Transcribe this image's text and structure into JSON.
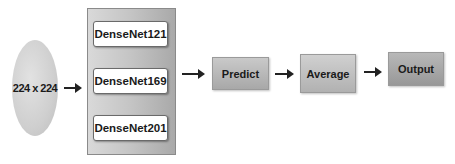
{
  "diagram": {
    "input": {
      "label": "224 x 224",
      "shape": "ellipse"
    },
    "ensemble": {
      "models": [
        {
          "label": "DenseNet121"
        },
        {
          "label": "DenseNet169"
        },
        {
          "label": "DenseNet201"
        }
      ]
    },
    "steps": [
      {
        "label": "Predict"
      },
      {
        "label": "Average"
      },
      {
        "label": "Output"
      }
    ],
    "edges": [
      {
        "from": "224 x 224",
        "to": "ensemble"
      },
      {
        "from": "ensemble",
        "to": "Predict"
      },
      {
        "from": "Predict",
        "to": "Average"
      },
      {
        "from": "Average",
        "to": "Output"
      }
    ]
  }
}
